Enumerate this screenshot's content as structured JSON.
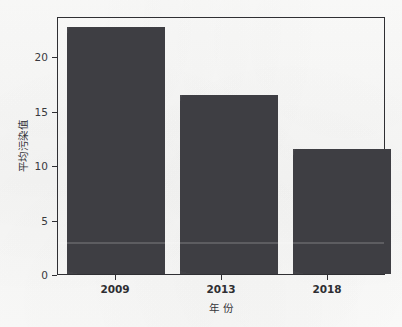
{
  "chart_data": {
    "type": "bar",
    "title": "",
    "subtitle": "",
    "xlabel": "年  份",
    "ylabel": "平均污染值",
    "categories": [
      "2009",
      "2013",
      "2018"
    ],
    "values": [
      22.4,
      16.2,
      11.3
    ],
    "series": [
      {
        "name": "平均污染值",
        "values": [
          22.4,
          16.2,
          11.3
        ]
      }
    ],
    "ylim": [
      0,
      23.2
    ],
    "yticks": [
      0,
      5,
      10,
      15,
      20
    ],
    "ytick_labels": [
      "0",
      "5",
      "10",
      "15",
      "20"
    ],
    "xtick_labels": [
      "2009",
      "2013",
      "2018"
    ],
    "grid": false,
    "legend": null,
    "legend_position": "none",
    "bar_color": "#414146",
    "axis_color": "#2f2f33",
    "background_color": "#fbfbfa",
    "annotations": []
  }
}
